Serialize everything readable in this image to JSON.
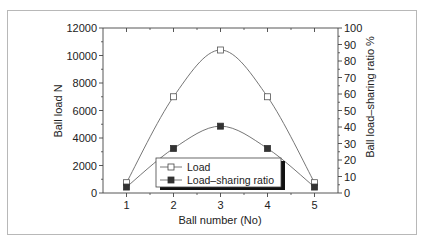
{
  "chart_data": {
    "type": "line",
    "title": "",
    "xlabel": "Ball number (No)",
    "ylabel": "Ball load  N",
    "y2label": "Ball load–sharing ratio  %",
    "categories": [
      1,
      2,
      3,
      4,
      5
    ],
    "x_ticks": [
      "1",
      "2",
      "3",
      "4",
      "5"
    ],
    "xlim": [
      0.5,
      5.5
    ],
    "ylim": [
      0,
      12000
    ],
    "y_ticks": [
      "0",
      "2000",
      "4000",
      "6000",
      "8000",
      "10000",
      "12000"
    ],
    "y2lim": [
      0,
      100
    ],
    "y2_ticks": [
      "0",
      "10",
      "20",
      "30",
      "40",
      "50",
      "60",
      "70",
      "80",
      "90",
      "100"
    ],
    "grid": false,
    "legend_position": "lower center (inside plot)",
    "series": [
      {
        "name": "Load",
        "axis": "left",
        "marker": "open-square",
        "values": [
          750,
          7000,
          10400,
          7000,
          750
        ]
      },
      {
        "name": "Load-sharing ratio",
        "axis": "right",
        "marker": "filled-square",
        "values": [
          3.6,
          27,
          40.5,
          27,
          3.6
        ]
      }
    ]
  },
  "legend": {
    "items": [
      {
        "label": "Load"
      },
      {
        "label": "Load–sharing ratio"
      }
    ]
  }
}
